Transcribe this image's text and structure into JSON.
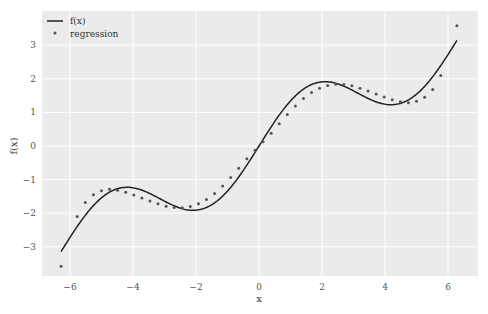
{
  "chart_data": {
    "type": "line",
    "title": "",
    "xlabel": "x",
    "ylabel": "f(x)",
    "xlim": [
      -6.9,
      6.9
    ],
    "ylim": [
      -3.9,
      3.95
    ],
    "grid": true,
    "legend_position": "upper left",
    "xticks": [
      -6,
      -4,
      -2,
      0,
      2,
      4,
      6
    ],
    "xtick_labels": [
      "−6",
      "−4",
      "−2",
      "0",
      "2",
      "4",
      "6"
    ],
    "yticks": [
      -3,
      -2,
      -1,
      0,
      1,
      2,
      3
    ],
    "ytick_labels": [
      "−3",
      "−2",
      "−1",
      "0",
      "1",
      "2",
      "3"
    ],
    "background": "#ebebeb",
    "grid_color": "#ffffff",
    "series": [
      {
        "name": "f(x)",
        "kind": "line",
        "color": "#222222",
        "expression": "x/2 + sin(x)",
        "x_range": [
          -6.2832,
          6.2832
        ]
      },
      {
        "name": "regression",
        "kind": "scatter",
        "color": "#555555",
        "x": [
          -6.283,
          -5.77,
          -5.514,
          -5.257,
          -5.001,
          -4.744,
          -4.488,
          -4.231,
          -3.975,
          -3.719,
          -3.462,
          -3.206,
          -2.949,
          -2.693,
          -2.436,
          -2.18,
          -1.923,
          -1.667,
          -1.411,
          -1.154,
          -0.898,
          -0.641,
          -0.385,
          -0.128,
          0.128,
          0.385,
          0.641,
          0.898,
          1.154,
          1.411,
          1.667,
          1.923,
          2.18,
          2.436,
          2.693,
          2.949,
          3.206,
          3.462,
          3.719,
          3.975,
          4.231,
          4.488,
          4.744,
          5.001,
          5.257,
          5.514,
          5.77,
          6.283
        ],
        "y": [
          -3.58,
          -2.1,
          -1.68,
          -1.45,
          -1.33,
          -1.29,
          -1.32,
          -1.38,
          -1.46,
          -1.55,
          -1.64,
          -1.72,
          -1.79,
          -1.83,
          -1.84,
          -1.8,
          -1.72,
          -1.59,
          -1.41,
          -1.19,
          -0.94,
          -0.66,
          -0.38,
          -0.13,
          0.13,
          0.38,
          0.66,
          0.94,
          1.19,
          1.41,
          1.59,
          1.72,
          1.8,
          1.84,
          1.83,
          1.79,
          1.72,
          1.64,
          1.55,
          1.46,
          1.38,
          1.32,
          1.29,
          1.33,
          1.45,
          1.68,
          2.1,
          3.58
        ]
      }
    ]
  },
  "legend": {
    "items": [
      {
        "label": "f(x)",
        "symbol": "line"
      },
      {
        "label": "regression",
        "symbol": "dot"
      }
    ]
  },
  "axes": {
    "xlabel": "x",
    "ylabel": "f(x)"
  }
}
